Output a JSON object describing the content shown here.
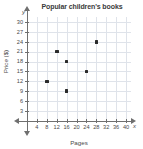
{
  "chart_data": {
    "type": "scatter",
    "title": "Popular children's books",
    "xlabel": "Pages",
    "ylabel": "Price ($)",
    "xlim": [
      0,
      42
    ],
    "ylim": [
      0,
      31.5
    ],
    "grid": true,
    "legend": null,
    "x_axis_letter": "x",
    "y_axis_letter": "y",
    "xticks": [
      4,
      8,
      12,
      16,
      20,
      24,
      28,
      32,
      36,
      40
    ],
    "yticks": [
      3,
      6,
      9,
      12,
      15,
      18,
      21,
      24,
      27,
      30
    ],
    "points": [
      {
        "x": 8,
        "y": 12
      },
      {
        "x": 12,
        "y": 21
      },
      {
        "x": 16,
        "y": 18
      },
      {
        "x": 16,
        "y": 9
      },
      {
        "x": 24,
        "y": 15
      },
      {
        "x": 28,
        "y": 24
      }
    ],
    "colors": {
      "point": "#2b2b2b",
      "axis": "#6f6f6f",
      "grid": "#dfe3ea",
      "text": "#4a4a4a",
      "title": "#3b3b3b"
    }
  }
}
